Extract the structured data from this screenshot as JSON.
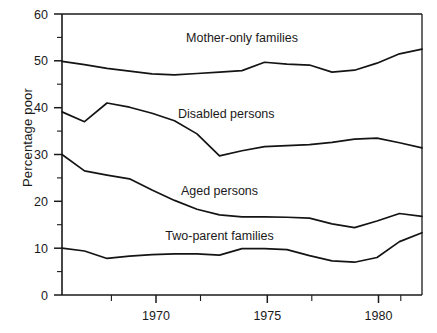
{
  "chart_data": {
    "type": "line",
    "title": "",
    "xlabel": "",
    "ylabel": "Percentage poor",
    "xlim": [
      1967,
      1983
    ],
    "ylim": [
      0,
      60
    ],
    "grid": false,
    "legend_position": "inline-annotations",
    "y_ticks_major": [
      0,
      10,
      20,
      30,
      40,
      50,
      60
    ],
    "y_ticks_minor": [
      5,
      15,
      25,
      35,
      45,
      55
    ],
    "x_ticks_major": [
      1970,
      1975,
      1980
    ],
    "x_tick_labels": [
      "1970",
      "1975",
      "1980"
    ],
    "x_ticks_minor": [
      1968,
      1972,
      1977,
      1982
    ],
    "x": [
      1967,
      1968,
      1969,
      1970,
      1971,
      1972,
      1973,
      1974,
      1975,
      1976,
      1977,
      1978,
      1979,
      1980,
      1981,
      1982,
      1983
    ],
    "series": [
      {
        "name": "Mother-only families",
        "label": "Mother-only families",
        "label_x": 1975.0,
        "label_y": 54.0,
        "values": [
          49.9,
          49.2,
          48.4,
          47.8,
          47.2,
          47.0,
          47.3,
          47.6,
          47.9,
          49.7,
          49.3,
          49.1,
          47.6,
          48.0,
          49.5,
          51.5,
          52.5
        ]
      },
      {
        "name": "Disabled persons",
        "label": "Disabled persons",
        "label_x": 1974.3,
        "label_y": 37.8,
        "values": [
          39.1,
          37.0,
          41.0,
          40.1,
          38.8,
          37.2,
          34.4,
          29.7,
          30.8,
          31.7,
          31.9,
          32.1,
          32.6,
          33.3,
          33.5,
          32.5,
          31.4
        ]
      },
      {
        "name": "Aged persons",
        "label": "Aged persons",
        "label_x": 1974.0,
        "label_y": 21.4,
        "values": [
          30.0,
          26.5,
          25.6,
          24.8,
          22.4,
          20.2,
          18.3,
          17.1,
          16.7,
          16.7,
          16.6,
          16.4,
          15.2,
          14.4,
          15.8,
          17.4,
          16.8
        ]
      },
      {
        "name": "Two-parent families",
        "label": "Two-parent families",
        "label_x": 1974.0,
        "label_y": 11.8,
        "values": [
          10.0,
          9.4,
          7.8,
          8.3,
          8.6,
          8.8,
          8.8,
          8.5,
          9.9,
          9.9,
          9.7,
          8.4,
          7.3,
          7.0,
          8.0,
          11.4,
          13.3
        ]
      }
    ]
  }
}
